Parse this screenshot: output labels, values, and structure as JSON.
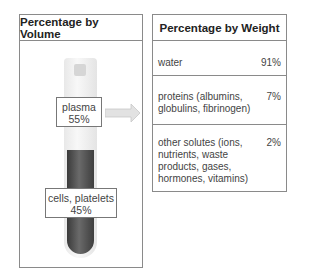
{
  "volume_panel": {
    "title": "Percentage by Volume",
    "plasma": {
      "label": "plasma",
      "percent": "55%"
    },
    "cells": {
      "label": "cells, platelets",
      "percent": "45%"
    }
  },
  "weight_panel": {
    "title": "Percentage by Weight",
    "rows": [
      {
        "label": "water",
        "percent": "91%"
      },
      {
        "label": "proteins (albumins,\nglobulins, fibrinogen)",
        "percent": "7%"
      },
      {
        "label": "other solutes (ions,\nnutrients, waste\nproducts, gases,\nhormones, vitamins)",
        "percent": "2%"
      }
    ]
  },
  "colors": {
    "border": "#8a8a8a",
    "cells": "#4a4a4a",
    "plasma": "#f2f2f2",
    "arrow": "#d9d9d9"
  }
}
